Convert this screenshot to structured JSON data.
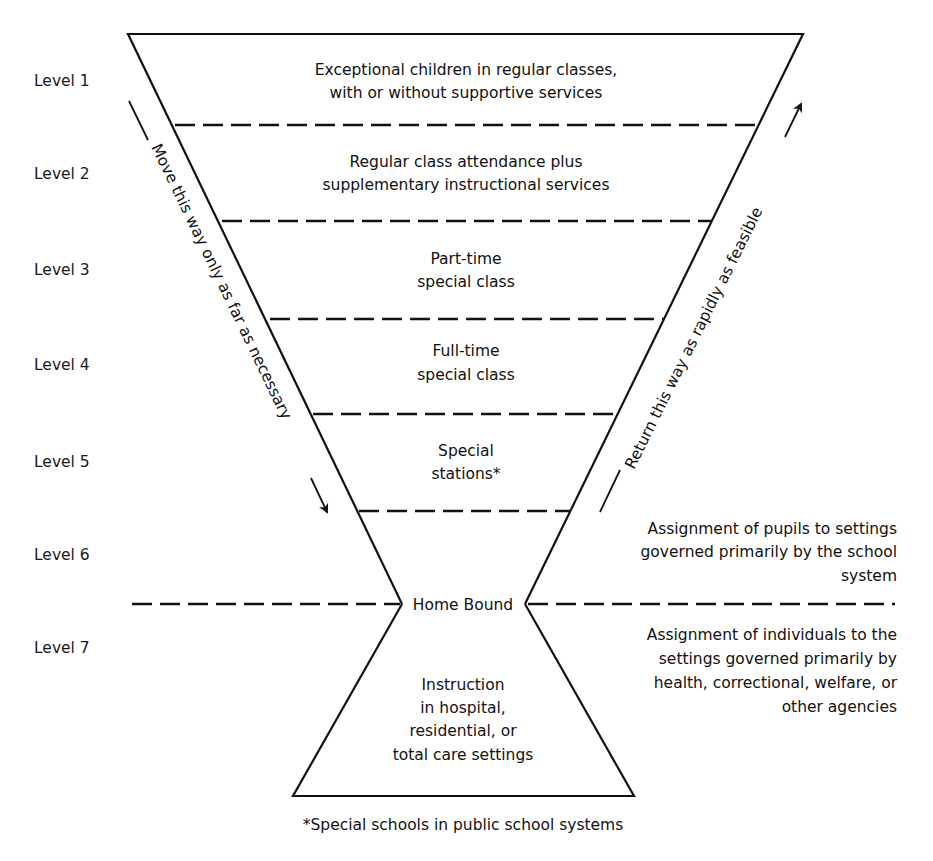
{
  "levels": [
    {
      "label": "Level 1",
      "lines": [
        "Exceptional children in regular classes,",
        "with or without supportive services"
      ]
    },
    {
      "label": "Level 2",
      "lines": [
        "Regular class attendance plus",
        "supplementary instructional services"
      ]
    },
    {
      "label": "Level 3",
      "lines": [
        "Part-time",
        "special class"
      ]
    },
    {
      "label": "Level 4",
      "lines": [
        "Full-time",
        "special class"
      ]
    },
    {
      "label": "Level 5",
      "lines": [
        "Special",
        "stations*"
      ]
    },
    {
      "label": "Level 6",
      "lines": []
    },
    {
      "label": "Level 7",
      "lines": [
        "Instruction",
        "in hospital,",
        "residential, or",
        "total care settings"
      ]
    }
  ],
  "home_bound": "Home Bound",
  "arrows": {
    "down": "Move this way only as far as necessary",
    "up": "Return this way as rapidly as feasible"
  },
  "side_notes": {
    "school_system": [
      "Assignment of pupils to settings",
      "governed primarily by the school",
      "system"
    ],
    "other_agencies": [
      "Assignment of individuals to the",
      "settings governed primarily by",
      "health, correctional, welfare, or",
      "other agencies"
    ]
  },
  "footnote": "*Special schools in public school systems"
}
